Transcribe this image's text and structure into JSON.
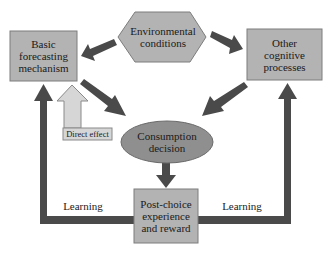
{
  "diagram": {
    "nodes": {
      "basic_forecasting": {
        "label": "Basic forecasting mechanism",
        "lines": [
          "Basic",
          "forecasting",
          "mechanism"
        ],
        "shape": "rectangle"
      },
      "environmental": {
        "label": "Environmental conditions",
        "lines": [
          "Environmental",
          "conditions"
        ],
        "shape": "hexagon"
      },
      "other_cognitive": {
        "label": "Other cognitive processes",
        "lines": [
          "Other",
          "cognitive",
          "processes"
        ],
        "shape": "rectangle"
      },
      "consumption": {
        "label": "Consumption decision",
        "lines": [
          "Consumption",
          "decision"
        ],
        "shape": "ellipse"
      },
      "post_choice": {
        "label": "Post-choice experience and reward",
        "lines": [
          "Post-choice",
          "experience",
          "and reward"
        ],
        "shape": "rectangle"
      }
    },
    "edge_labels": {
      "direct_effect": "Direct effect",
      "learning_left": "Learning",
      "learning_right": "Learning"
    },
    "edges": [
      {
        "from": "environmental",
        "to": "basic_forecasting"
      },
      {
        "from": "environmental",
        "to": "other_cognitive"
      },
      {
        "from": "basic_forecasting",
        "to": "consumption"
      },
      {
        "from": "other_cognitive",
        "to": "consumption"
      },
      {
        "from": "consumption",
        "to": "basic_forecasting",
        "label": "Direct effect"
      },
      {
        "from": "consumption",
        "to": "post_choice"
      },
      {
        "from": "post_choice",
        "to": "basic_forecasting",
        "label": "Learning"
      },
      {
        "from": "post_choice",
        "to": "other_cognitive",
        "label": "Learning"
      }
    ],
    "colors": {
      "box_fill": "#b3b3b3",
      "box_stroke": "#7d7d7d",
      "arrow_dark": "#4a4a4a",
      "direct_effect_fill": "#d6d6d6",
      "ellipse_fill": "#8f8f8f",
      "text": "#1a1a1a"
    }
  }
}
